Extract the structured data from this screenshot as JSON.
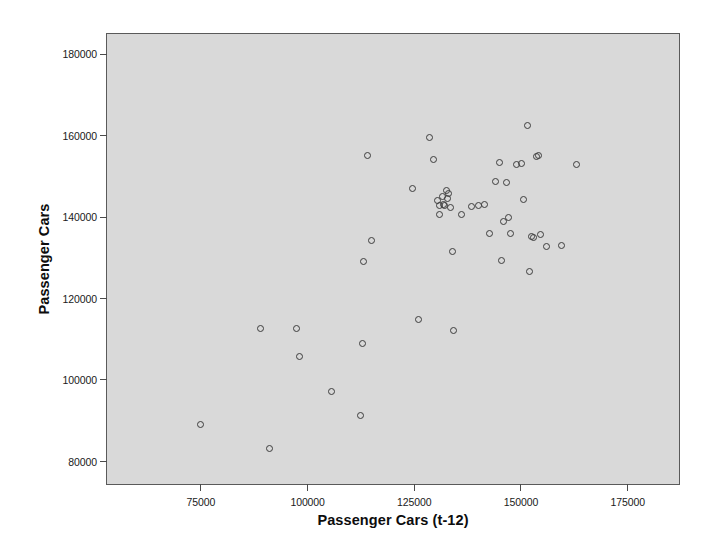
{
  "chart_data": {
    "type": "scatter",
    "title": "",
    "xlabel": "Passenger Cars (t-12)",
    "ylabel": "Passenger Cars",
    "grid": false,
    "legend": null,
    "xlim": [
      53000,
      187000
    ],
    "ylim": [
      74500,
      185000
    ],
    "xticks": [
      75000,
      100000,
      125000,
      150000,
      175000
    ],
    "xtick_labels": [
      "75000",
      "100000",
      "125000",
      "150000",
      "175000"
    ],
    "yticks": [
      80000,
      100000,
      120000,
      140000,
      160000,
      180000
    ],
    "ytick_labels": [
      "80000",
      "100000",
      "120000",
      "140000",
      "160000",
      "180000"
    ],
    "marker": "open-circle",
    "marker_color": "#3d3d3d",
    "plot_background": "#d9d9d9",
    "n_points": 52,
    "points": [
      [
        75000,
        89200
      ],
      [
        89000,
        112800
      ],
      [
        91000,
        83100
      ],
      [
        97500,
        112600
      ],
      [
        98000,
        105800
      ],
      [
        105500,
        97200
      ],
      [
        112500,
        91300
      ],
      [
        112800,
        109100
      ],
      [
        113000,
        129100
      ],
      [
        114000,
        155100
      ],
      [
        115000,
        134400
      ],
      [
        124500,
        147100
      ],
      [
        126000,
        114800
      ],
      [
        128500,
        159700
      ],
      [
        129500,
        154300
      ],
      [
        130500,
        144200
      ],
      [
        131000,
        142900
      ],
      [
        131500,
        145100
      ],
      [
        131800,
        143100
      ],
      [
        132000,
        143000
      ],
      [
        132500,
        146600
      ],
      [
        133000,
        145800
      ],
      [
        133500,
        142400
      ],
      [
        134000,
        131500
      ],
      [
        134200,
        112200
      ],
      [
        136000,
        140800
      ],
      [
        138500,
        142700
      ],
      [
        140000,
        142900
      ],
      [
        141500,
        143100
      ],
      [
        142500,
        135900
      ],
      [
        144000,
        148700
      ],
      [
        145000,
        153500
      ],
      [
        145500,
        129400
      ],
      [
        146000,
        139000
      ],
      [
        146500,
        148500
      ],
      [
        147000,
        140000
      ],
      [
        147500,
        136100
      ],
      [
        149000,
        152900
      ],
      [
        150000,
        153200
      ],
      [
        150500,
        144300
      ],
      [
        151500,
        162600
      ],
      [
        152000,
        126700
      ],
      [
        152500,
        135200
      ],
      [
        153000,
        135000
      ],
      [
        153500,
        155000
      ],
      [
        154000,
        155100
      ],
      [
        154500,
        135800
      ],
      [
        156000,
        132800
      ],
      [
        159500,
        133100
      ],
      [
        163000,
        152900
      ],
      [
        131000,
        140600
      ],
      [
        132800,
        144500
      ]
    ]
  },
  "axes": {
    "y_title": "Passenger Cars",
    "x_title": "Passenger Cars (t-12)"
  }
}
